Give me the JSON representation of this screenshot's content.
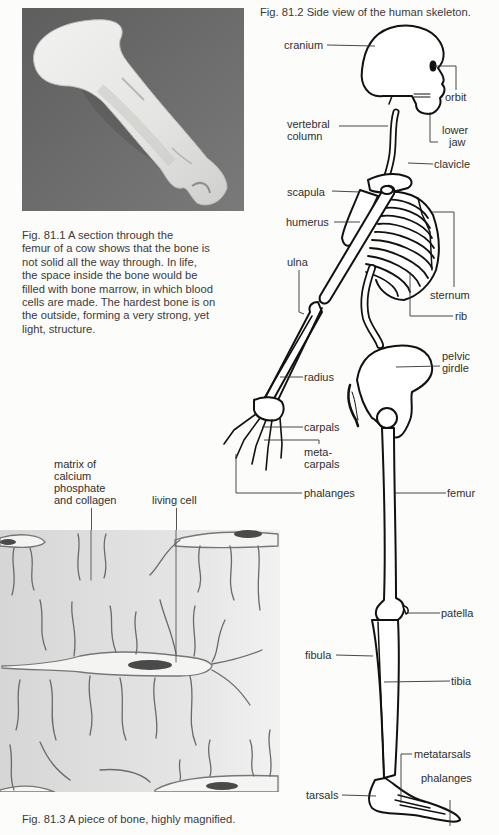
{
  "figures": {
    "fig1": {
      "image_alt": "section through cow femur photograph",
      "caption_lines": [
        "Fig. 81.1  A section through the",
        "femur of a cow shows that the bone is",
        "not solid all the way through. In life,",
        "the space inside the bone would be",
        "filled with bone marrow, in which blood",
        "cells are made. The hardest bone is on",
        "the outside, forming a very strong, yet",
        "light, structure."
      ]
    },
    "fig2": {
      "caption": "Fig. 81.2  Side view of the human skeleton.",
      "labels": {
        "cranium": "cranium",
        "orbit": "orbit",
        "vertebral_1": "vertebral",
        "vertebral_2": "column",
        "lower_jaw_1": "lower",
        "lower_jaw_2": "jaw",
        "clavicle": "clavicle",
        "scapula": "scapula",
        "humerus": "humerus",
        "ulna": "ulna",
        "sternum": "sternum",
        "rib": "rib",
        "pelvic_1": "pelvic",
        "pelvic_2": "girdle",
        "radius": "radius",
        "carpals": "carpals",
        "metacarpals_1": "meta-",
        "metacarpals_2": "carpals",
        "phalanges_hand": "phalanges",
        "femur": "femur",
        "patella": "patella",
        "fibula": "fibula",
        "tibia": "tibia",
        "metatarsals": "metatarsals",
        "phalanges_foot": "phalanges",
        "tarsals": "tarsals"
      }
    },
    "fig3": {
      "caption": "Fig. 81.3  A piece of bone, highly magnified.",
      "labels": {
        "matrix_1": "matrix of",
        "matrix_2": "calcium",
        "matrix_3": "phosphate",
        "matrix_4": "and collagen",
        "living_cell": "living cell"
      }
    }
  }
}
